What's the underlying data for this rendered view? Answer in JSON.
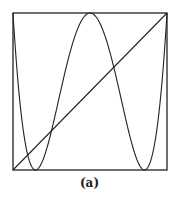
{
  "caption": "(a)",
  "chart_data": {
    "type": "line",
    "title": "",
    "caption": "(a)",
    "xlabel": "",
    "ylabel": "",
    "xlim": [
      0,
      1
    ],
    "ylim": [
      0,
      1
    ],
    "grid": false,
    "legend": "none",
    "series": [
      {
        "name": "f(x) = (T4(2x-1)+1)/2",
        "x": [
          0,
          0.1,
          0.146,
          0.2,
          0.3,
          0.4,
          0.5,
          0.6,
          0.7,
          0.8,
          0.854,
          0.9,
          1
        ],
        "values": [
          1,
          0.094,
          0,
          0.094,
          0.655,
          0.965,
          1,
          0.965,
          0.655,
          0.094,
          0,
          0.094,
          1
        ]
      },
      {
        "name": "y = x",
        "x": [
          0,
          1
        ],
        "values": [
          0,
          1
        ]
      }
    ]
  }
}
